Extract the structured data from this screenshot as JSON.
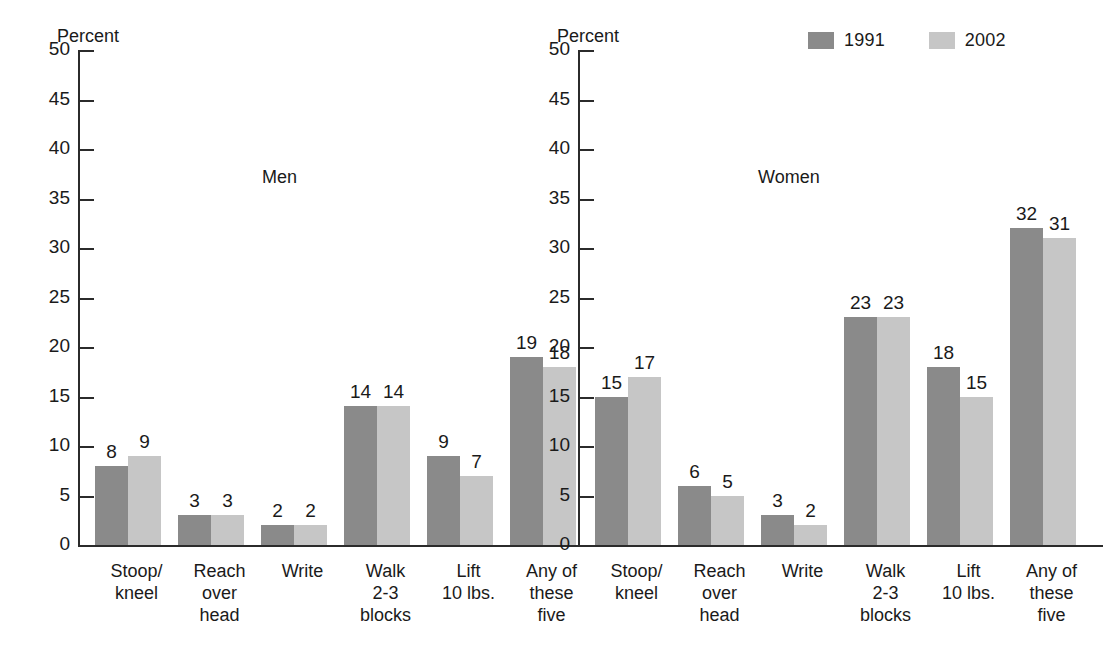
{
  "axis": {
    "title": "Percent",
    "ticks": [
      "50",
      "45",
      "40",
      "35",
      "30",
      "25",
      "20",
      "15",
      "10",
      "5",
      "0"
    ],
    "min": 0,
    "max": 50,
    "step": 5
  },
  "legend": {
    "items": [
      {
        "label": "1991",
        "color": "#8a8a8a"
      },
      {
        "label": "2002",
        "color": "#c6c6c6"
      }
    ]
  },
  "panels": [
    {
      "name": "Men"
    },
    {
      "name": "Women"
    }
  ],
  "categories": [
    "Stoop/\nkneel",
    "Reach\nover\nhead",
    "Write",
    "Walk\n2-3\nblocks",
    "Lift\n10 lbs.",
    "Any of\nthese\nfive"
  ],
  "chart_data": {
    "type": "bar",
    "title": "",
    "subtitle": "",
    "xlabel": "",
    "ylabel": "Percent",
    "ylim": [
      0,
      50
    ],
    "ytick_step": 5,
    "grid": false,
    "legend_position": "top-right",
    "panels": [
      {
        "panel": "Men",
        "categories": [
          "Stoop/kneel",
          "Reach over head",
          "Write",
          "Walk 2-3 blocks",
          "Lift 10 lbs.",
          "Any of these five"
        ],
        "series": [
          {
            "name": "1991",
            "color": "#8a8a8a",
            "values": [
              8,
              3,
              2,
              14,
              9,
              19
            ]
          },
          {
            "name": "2002",
            "color": "#c6c6c6",
            "values": [
              9,
              3,
              2,
              14,
              7,
              18
            ]
          }
        ]
      },
      {
        "panel": "Women",
        "categories": [
          "Stoop/kneel",
          "Reach over head",
          "Write",
          "Walk 2-3 blocks",
          "Lift 10 lbs.",
          "Any of these five"
        ],
        "series": [
          {
            "name": "1991",
            "color": "#8a8a8a",
            "values": [
              15,
              6,
              3,
              23,
              18,
              32
            ]
          },
          {
            "name": "2002",
            "color": "#c6c6c6",
            "values": [
              17,
              5,
              2,
              23,
              15,
              31
            ]
          }
        ]
      }
    ]
  }
}
